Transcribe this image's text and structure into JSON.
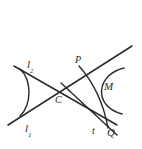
{
  "figure": {
    "type": "geometry-construction-diagram",
    "canvas": {
      "width": 142,
      "height": 149,
      "background": "#ffffff"
    },
    "stroke_color": "#2b2b2b",
    "labels": {
      "line1": {
        "text": "l",
        "subscript": "1"
      },
      "line2": {
        "text": "l",
        "subscript": "2"
      },
      "center": "C",
      "point_p": "P",
      "point_m": "M",
      "tangent": "t",
      "point_q": "Q"
    },
    "elements": [
      {
        "name": "line-l2",
        "kind": "line",
        "from": [
          14,
          66
        ],
        "to": [
          117,
          125
        ]
      },
      {
        "name": "line-l1",
        "kind": "line",
        "from": [
          8,
          125
        ],
        "to": [
          132,
          46
        ]
      },
      {
        "name": "line-tangent-t",
        "kind": "line",
        "from": [
          62,
          84
        ],
        "to": [
          116,
          134
        ]
      },
      {
        "name": "arc-left",
        "kind": "arc",
        "opens": "left"
      },
      {
        "name": "arc-right-M",
        "kind": "arc",
        "opens": "right"
      },
      {
        "name": "arc-through-PQ",
        "kind": "arc",
        "from": [
          79,
          66
        ],
        "to": [
          108,
          127
        ]
      },
      {
        "name": "intersection-C",
        "kind": "point",
        "at": [
          62,
          90
        ]
      },
      {
        "name": "point-P",
        "kind": "point",
        "at": [
          79,
          67
        ]
      },
      {
        "name": "point-Q",
        "kind": "point",
        "at": [
          108,
          126
        ]
      }
    ]
  }
}
